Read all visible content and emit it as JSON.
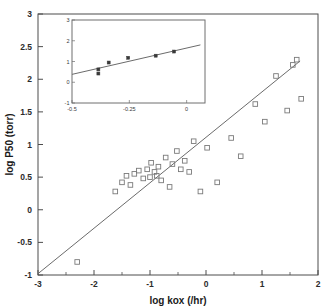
{
  "chart_data": {
    "type": "scatter",
    "title": "",
    "xlabel": "log kox (/hr)",
    "ylabel": "log P50 (torr)",
    "xlim": [
      -3,
      2
    ],
    "ylim": [
      -1,
      3
    ],
    "xticks": [
      -3,
      -2,
      -1,
      0,
      1,
      2
    ],
    "xticklabels": [
      "-3",
      "-2",
      "-1",
      "0",
      "1",
      "2"
    ],
    "yticks": [
      -1,
      -0.5,
      0,
      0.5,
      1,
      1.5,
      2,
      2.5,
      3
    ],
    "yticklabels": [
      "-1",
      "-0.5",
      "0",
      "0.5",
      "1",
      "1.5",
      "2",
      "2.5",
      "3"
    ],
    "grid": false,
    "legend": "none",
    "marker_style": "open-square",
    "series": [
      {
        "name": "main scatter",
        "x": [
          -2.3,
          -1.62,
          -1.5,
          -1.42,
          -1.35,
          -1.28,
          -1.2,
          -1.12,
          -1.05,
          -1.0,
          -0.98,
          -0.92,
          -0.88,
          -0.85,
          -0.8,
          -0.72,
          -0.65,
          -0.6,
          -0.52,
          -0.45,
          -0.38,
          -0.3,
          -0.22,
          -0.1,
          0.02,
          0.2,
          0.45,
          0.62,
          0.88,
          1.05,
          1.25,
          1.45,
          1.55,
          1.62,
          1.7
        ],
        "y": [
          -0.8,
          0.28,
          0.42,
          0.52,
          0.38,
          0.55,
          0.6,
          0.48,
          0.62,
          0.5,
          0.72,
          0.58,
          0.52,
          0.66,
          0.45,
          0.8,
          0.35,
          0.7,
          0.9,
          0.62,
          0.75,
          0.58,
          1.05,
          0.28,
          0.95,
          0.42,
          1.1,
          0.82,
          1.62,
          1.35,
          2.05,
          1.52,
          2.22,
          2.3,
          1.7
        ]
      }
    ],
    "fit_line": {
      "name": "regression line",
      "x_start": -3.0,
      "y_start": -0.98,
      "x_end": 1.68,
      "y_end": 2.28
    }
  },
  "inset": {
    "xlabel": "",
    "ylabel": "",
    "xlim": [
      -0.5,
      0.08
    ],
    "ylim": [
      -1,
      3
    ],
    "xticks": [
      -0.5,
      -0.25,
      0
    ],
    "xticklabels": [
      "-0.5",
      "-0.25",
      "0"
    ],
    "yticks": [
      -1,
      0,
      1,
      2,
      3
    ],
    "yticklabels": [
      "-1",
      "0",
      "1",
      "2",
      "3"
    ],
    "marker_style": "filled-square",
    "series": [
      {
        "name": "inset scatter",
        "x": [
          -0.385,
          -0.385,
          -0.34,
          -0.255,
          -0.135,
          -0.055
        ],
        "y": [
          0.62,
          0.42,
          0.95,
          1.18,
          1.28,
          1.48
        ]
      }
    ],
    "fit_line": {
      "name": "inset regression line",
      "x_start": -0.5,
      "y_start": 0.38,
      "x_end": 0.06,
      "y_end": 1.8
    }
  }
}
